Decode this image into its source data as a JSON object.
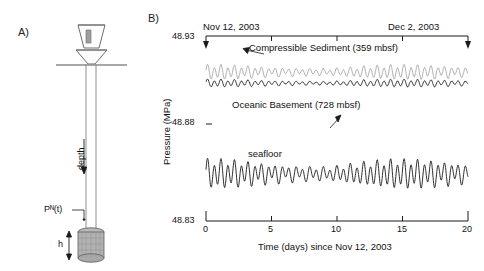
{
  "figure": {
    "panel_a_letter": "A)",
    "panel_b_letter": "B)"
  },
  "schematic": {
    "depth_label": "depth",
    "pressure_label": "Pᴺ(t)",
    "height_label": "h",
    "parts": {
      "funnel": "reentry-cone",
      "casing": "borehole-casing",
      "seafloor_line": "seafloor-line",
      "packer": "packer-screen"
    }
  },
  "chart_data": {
    "type": "line",
    "title": "",
    "xlabel": "Time (days) since Nov 12, 2003",
    "ylabel": "Pressure (MPa)",
    "xlim": [
      0,
      20
    ],
    "ylim": [
      48.83,
      48.93
    ],
    "xticks": [
      "0",
      "5",
      "10",
      "15",
      "20"
    ],
    "xtick_values": [
      0,
      5,
      10,
      15,
      20
    ],
    "yticks": [
      "48.83",
      "48.88",
      "48.93"
    ],
    "ytick_values": [
      48.83,
      48.88,
      48.93
    ],
    "grid": false,
    "legend": "inline-annotations",
    "start_date": "Nov 12, 2003",
    "end_date": "Dec 2, 2003",
    "series": [
      {
        "name": "Compressible Sediment (359 mbsf)",
        "color": "#9a9a9a",
        "baseline": 48.9105,
        "amplitude": 0.0042,
        "annotation": "Compressible Sediment (359 mbsf)"
      },
      {
        "name": "Oceanic Basement (728 mbsf)",
        "color": "#1a1a1a",
        "baseline": 48.9045,
        "amplitude": 0.0022,
        "annotation": "Oceanic Basement (728 mbsf)"
      },
      {
        "name": "seafloor",
        "color": "#1a1a1a",
        "baseline": 48.8555,
        "amplitude": 0.0085,
        "annotation": "seafloor"
      }
    ]
  }
}
